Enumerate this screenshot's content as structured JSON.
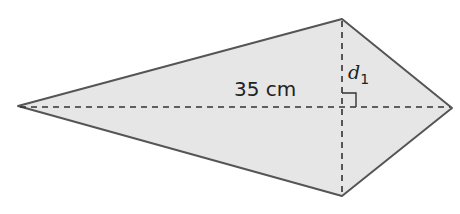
{
  "diagram": {
    "shape": "kite",
    "fill_color": "#e6e6e6",
    "stroke_color": "#555555",
    "dash_color": "#333333",
    "vertices": {
      "left": [
        18,
        106
      ],
      "top": [
        342,
        19
      ],
      "right": [
        452,
        108
      ],
      "bottom": [
        342,
        196
      ]
    },
    "labels": {
      "horizontal_diagonal": "35 cm",
      "vertical_segment_var": "d",
      "vertical_segment_sub": "1"
    },
    "right_angle_marker": true
  }
}
